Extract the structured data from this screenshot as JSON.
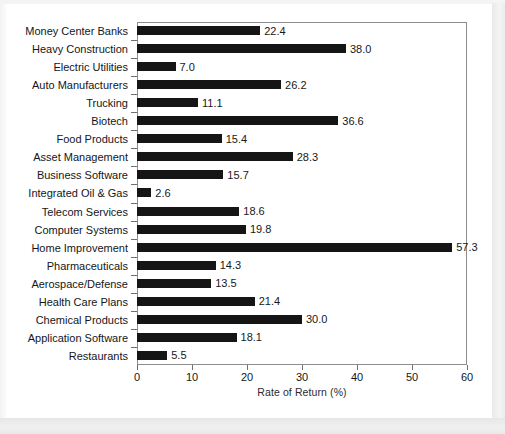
{
  "chart_data": {
    "type": "bar",
    "orientation": "horizontal",
    "title": "",
    "xlabel": "Rate of Return (%)",
    "ylabel": "",
    "xlim": [
      0,
      60
    ],
    "xticks": [
      0,
      10,
      20,
      30,
      40,
      50,
      60
    ],
    "grid": false,
    "legend": false,
    "bar_color": "#151515",
    "frame_color": "#8d8d8d",
    "value_label_format": "one-decimal",
    "categories": [
      "Money Center Banks",
      "Heavy Construction",
      "Electric Utilities",
      "Auto Manufacturers",
      "Trucking",
      "Biotech",
      "Food Products",
      "Asset Management",
      "Business Software",
      "Integrated Oil & Gas",
      "Telecom Services",
      "Computer Systems",
      "Home Improvement",
      "Pharmaceuticals",
      "Aerospace/Defense",
      "Health Care Plans",
      "Chemical Products",
      "Application Software",
      "Restaurants"
    ],
    "values": [
      22.4,
      38.0,
      7.0,
      26.2,
      11.1,
      36.6,
      15.4,
      28.3,
      15.7,
      2.6,
      18.6,
      19.8,
      57.3,
      14.3,
      13.5,
      21.4,
      30.0,
      18.1,
      5.5
    ],
    "value_labels": [
      "22.4",
      "38.0",
      "7.0",
      "26.2",
      "11.1",
      "36.6",
      "15.4",
      "28.3",
      "15.7",
      "2.6",
      "18.6",
      "19.8",
      "57.3",
      "14.3",
      "13.5",
      "21.4",
      "30.0",
      "18.1",
      "5.5"
    ],
    "xtick_labels": [
      "0",
      "10",
      "20",
      "30",
      "40",
      "50",
      "60"
    ]
  }
}
